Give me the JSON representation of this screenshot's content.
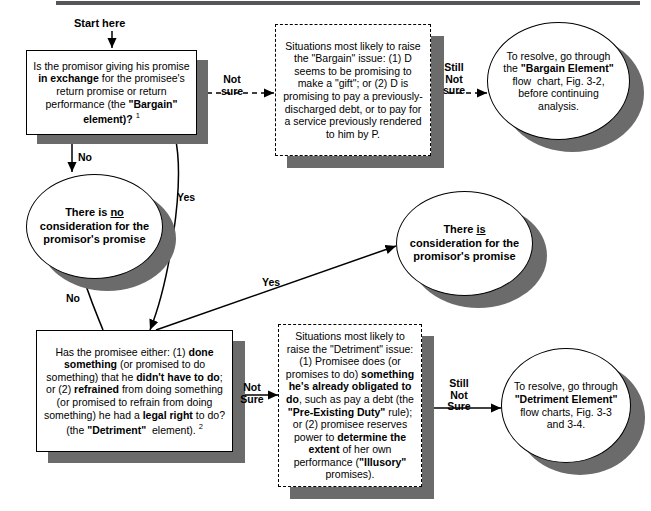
{
  "chart_title": "Figure 3-1 Consideration Flow Chart",
  "colors": {
    "ink": "#000000",
    "shadow": "#6b6b6b",
    "paper": "#ffffff",
    "page_rule": "#55565a"
  },
  "start_label": "Start here",
  "nodes": {
    "q_bargain": {
      "shape": "rect",
      "html": "Is the promisor giving his promise <b>in exchange</b> for the promisee's return promise or return performance (the <b>\"Bargain\" element)?</b> <sup>1</sup>",
      "plain": "Is the promisor giving his promise in exchange for the promisee's return promise or return performance (the \"Bargain\" element)? 1"
    },
    "note_bargain": {
      "shape": "rect-dashed",
      "html": "Situations most likely to raise the \"Bargain\" issue: (1) D seems to be promising to make a \"gift\"; or (2) D is promising to pay a previously-discharged debt, or to pay for a service previously rendered to him by P.",
      "plain": "Situations most likely to raise the \"Bargain\" issue: (1) D seems to be promising to make a \"gift\"; or (2) D is promising to pay a previously-discharged debt, or to pay for a service previously rendered to him by P."
    },
    "resolve_bargain": {
      "shape": "ellipse",
      "html": "To resolve, go through the <b>\"Bargain Element\"</b> flow&nbsp; chart, Fig. 3-2, before continuing analysis.",
      "plain": "To resolve, go through the \"Bargain Element\" flow chart, Fig. 3-2, before continuing analysis."
    },
    "no_consideration": {
      "shape": "ellipse",
      "html": "There is <u>no</u> consideration for the promisor's promise",
      "plain": "There is no consideration for the promisor's promise"
    },
    "is_consideration": {
      "shape": "ellipse",
      "html": "There <u>is</u> consideration for the promisor's promise",
      "plain": "There is consideration for the promisor's promise"
    },
    "q_detriment": {
      "shape": "rect",
      "html": "Has the promisee either: (1) <b>done something</b> (or promised to do something) that he <b>didn't have to do</b>; or (2) <b>refrained</b> from doing something (or promised to refrain from doing something) he had a <b>legal right</b> to do? (the <b>\"Detriment\"</b> &nbsp;element). <sup>2</sup>",
      "plain": "Has the promisee either: (1) done something (or promised to do something) that he didn't have to do; or (2) refrained from doing something (or promised to refrain from doing something) he had a legal right to do? (the \"Detriment\" element). 2"
    },
    "note_detriment": {
      "shape": "rect-dashed",
      "html": "Situations most likely to raise the \"Detriment\" issue: (1) Promisee does (or promises to do) <b>something he's already obligated to do</b>, such as pay a debt (the <b>\"Pre-Existing Duty\"</b> rule); or (2) promisee reserves power to <b>determine the extent</b> of her own performance (<b>\"Illusory\"</b> promises).",
      "plain": "Situations most likely to raise the \"Detriment\" issue: (1) Promisee does (or promises to do) something he's already obligated to do, such as pay a debt (the \"Pre-Existing Duty\" rule); or (2) promisee reserves power to determine the extent of her own performance (\"Illusory\" promises)."
    },
    "resolve_detriment": {
      "shape": "ellipse",
      "html": "To resolve, go through <b>\"Detriment Element\"</b> flow charts, Fig. 3-3 and 3-4.",
      "plain": "To resolve, go through \"Detriment Element\" flow charts, Fig. 3-3 and 3-4."
    }
  },
  "edge_labels": {
    "bargain_not_sure": "Not\nsure",
    "bargain_still_not_sure": "Still\nNot\nsure",
    "bargain_no": "No",
    "bargain_yes": "Yes",
    "no_consideration_no": "No",
    "detriment_yes": "Yes",
    "detriment_not_sure": "Not\nSure",
    "detriment_still_not_sure": "Still\nNot\nSure"
  }
}
